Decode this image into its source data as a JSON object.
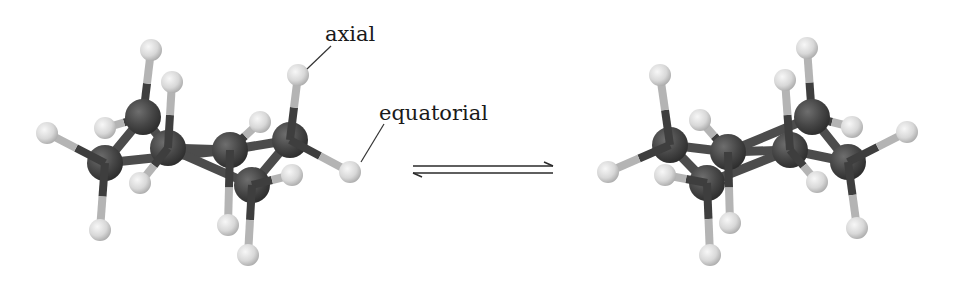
{
  "figure": {
    "labels": {
      "axial": "axial",
      "equatorial": "equatorial"
    },
    "colors": {
      "background": "#ffffff",
      "carbon": "#454545",
      "carbon_highlight": "#6a6a6a",
      "carbon_edge": "#2a2a2a",
      "hydrogen": "#dcdcdc",
      "hydrogen_highlight": "#f4f4f4",
      "hydrogen_edge": "#a8a8a8",
      "cc_bond": "#4c4c4c",
      "ch_bond_near_c": "#3e3e3e",
      "ch_bond_near_h": "#b4b4b4",
      "leader_line": "#333333",
      "arrow": "#2a2a2a"
    },
    "leaders": [
      {
        "name": "axial-leader-line",
        "x1": 331,
        "y1": 46,
        "x2": 307,
        "y2": 69
      },
      {
        "name": "equatorial-leader-line",
        "x1": 384,
        "y1": 124,
        "x2": 361,
        "y2": 162
      }
    ],
    "arrow": {
      "x1": 413,
      "x2": 553,
      "top_y": 166,
      "bottom_y": 173,
      "head_len": 9,
      "head_drop": 4,
      "type": "equilibrium"
    },
    "molecules": [
      {
        "name": "left-chair",
        "carbons": [
          {
            "id": "C1",
            "x": 143,
            "y": 117
          },
          {
            "id": "C2",
            "x": 168,
            "y": 148
          },
          {
            "id": "C3",
            "x": 105,
            "y": 163
          },
          {
            "id": "C4",
            "x": 230,
            "y": 150
          },
          {
            "id": "C5",
            "x": 290,
            "y": 140
          },
          {
            "id": "C6",
            "x": 252,
            "y": 185
          }
        ],
        "cc_bonds": [
          [
            "C1",
            "C2"
          ],
          [
            "C1",
            "C3"
          ],
          [
            "C2",
            "C4"
          ],
          [
            "C3",
            "C4"
          ],
          [
            "C2",
            "C6"
          ],
          [
            "C4",
            "C5"
          ],
          [
            "C5",
            "C6"
          ]
        ],
        "hydrogens": [
          {
            "c": "C1",
            "x": 151,
            "y": 50,
            "pos": "axial",
            "z": 0
          },
          {
            "c": "C1",
            "x": 105,
            "y": 128,
            "pos": "equatorial",
            "z": 0
          },
          {
            "c": "C2",
            "x": 172,
            "y": 82,
            "pos": "axial",
            "z": 1
          },
          {
            "c": "C2",
            "x": 140,
            "y": 183,
            "pos": "equatorial",
            "z": 1
          },
          {
            "c": "C3",
            "x": 47,
            "y": 133,
            "pos": "equatorial",
            "z": 1
          },
          {
            "c": "C3",
            "x": 100,
            "y": 230,
            "pos": "axial",
            "z": 1
          },
          {
            "c": "C4",
            "x": 260,
            "y": 122,
            "pos": "equatorial",
            "z": 0
          },
          {
            "c": "C4",
            "x": 228,
            "y": 225,
            "pos": "axial",
            "z": 1
          },
          {
            "c": "C5",
            "x": 298,
            "y": 75,
            "pos": "axial",
            "z": 1
          },
          {
            "c": "C5",
            "x": 350,
            "y": 172,
            "pos": "equatorial",
            "z": 1
          },
          {
            "c": "C6",
            "x": 292,
            "y": 175,
            "pos": "equatorial",
            "z": 1
          },
          {
            "c": "C6",
            "x": 248,
            "y": 255,
            "pos": "axial",
            "z": 1
          }
        ]
      },
      {
        "name": "right-chair",
        "carbons": [
          {
            "id": "C1",
            "x": 670,
            "y": 145
          },
          {
            "id": "C2",
            "x": 728,
            "y": 152
          },
          {
            "id": "C3",
            "x": 707,
            "y": 183
          },
          {
            "id": "C4",
            "x": 790,
            "y": 150
          },
          {
            "id": "C5",
            "x": 812,
            "y": 117
          },
          {
            "id": "C6",
            "x": 848,
            "y": 162
          }
        ],
        "cc_bonds": [
          [
            "C1",
            "C2"
          ],
          [
            "C1",
            "C3"
          ],
          [
            "C2",
            "C4"
          ],
          [
            "C3",
            "C4"
          ],
          [
            "C4",
            "C6"
          ],
          [
            "C2",
            "C5"
          ],
          [
            "C5",
            "C6"
          ]
        ],
        "hydrogens": [
          {
            "c": "C1",
            "x": 660,
            "y": 75,
            "pos": "axial",
            "z": 1
          },
          {
            "c": "C1",
            "x": 608,
            "y": 172,
            "pos": "equatorial",
            "z": 1
          },
          {
            "c": "C3",
            "x": 665,
            "y": 175,
            "pos": "equatorial",
            "z": 1
          },
          {
            "c": "C2",
            "x": 700,
            "y": 120,
            "pos": "equatorial",
            "z": 0
          },
          {
            "c": "C3",
            "x": 710,
            "y": 255,
            "pos": "axial",
            "z": 1
          },
          {
            "c": "C2",
            "x": 730,
            "y": 223,
            "pos": "axial",
            "z": 1
          },
          {
            "c": "C4",
            "x": 785,
            "y": 80,
            "pos": "axial",
            "z": 1
          },
          {
            "c": "C4",
            "x": 817,
            "y": 182,
            "pos": "equatorial",
            "z": 1
          },
          {
            "c": "C5",
            "x": 807,
            "y": 48,
            "pos": "axial",
            "z": 0
          },
          {
            "c": "C5",
            "x": 852,
            "y": 127,
            "pos": "equatorial",
            "z": 0
          },
          {
            "c": "C6",
            "x": 907,
            "y": 132,
            "pos": "equatorial",
            "z": 1
          },
          {
            "c": "C6",
            "x": 857,
            "y": 228,
            "pos": "axial",
            "z": 1
          }
        ]
      }
    ],
    "sizes": {
      "carbon_r": 18,
      "hydrogen_r": 11,
      "cc_bond_w": 9,
      "ch_bond_w": 8
    }
  }
}
